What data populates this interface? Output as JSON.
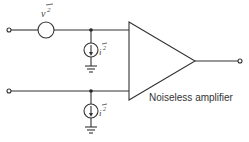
{
  "diagram": {
    "title": "",
    "amplifier_label": "Noiseless amplifier",
    "voltage_noise_source": {
      "symbol": "v",
      "superscript": "2",
      "overbar": true,
      "label": "v²"
    },
    "current_noise_source_top": {
      "symbol": "i",
      "superscript": "2",
      "overbar": true,
      "label": "i²"
    },
    "current_noise_source_bottom": {
      "symbol": "i",
      "superscript": "2",
      "overbar": true,
      "label": "i²"
    },
    "colors": {
      "stroke": "#333333",
      "background": "#ffffff"
    }
  }
}
